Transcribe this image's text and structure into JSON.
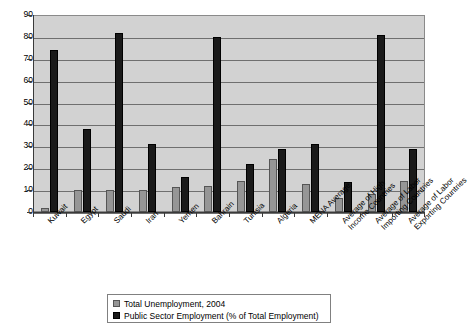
{
  "chart_data": {
    "type": "bar",
    "title": "",
    "xlabel": "",
    "ylabel": "",
    "ylim": [
      0,
      90
    ],
    "ytick_step": 10,
    "yticks": [
      90,
      80,
      70,
      60,
      50,
      40,
      30,
      20,
      10,
      0
    ],
    "grid": true,
    "legend_position": "bottom",
    "categories": [
      "Kuwait",
      "Egypt",
      "Saudi",
      "Iran",
      "Yemen",
      "Bahrain",
      "Tunisia",
      "Algeria",
      "MENA Average",
      "Average of High\nIncome Countries",
      "Average of Labor\nImporting Countries",
      "Average of Labor\nExporting Countries"
    ],
    "series": [
      {
        "name": "Total Unemployment, 2004",
        "color": "#969696",
        "values": [
          2,
          10,
          10,
          10,
          11.5,
          12,
          14,
          24,
          13,
          6.5,
          8,
          14
        ]
      },
      {
        "name": "Public Sector Employment (% of Total Employment)",
        "color": "#1a1a1a",
        "values": [
          74,
          38,
          82,
          31,
          16,
          80,
          22,
          29,
          31,
          13.5,
          81,
          29
        ]
      }
    ]
  },
  "legend": {
    "items": [
      {
        "label": "Total Unemployment, 2004",
        "swatch": "gray"
      },
      {
        "label": "Public Sector Employment (% of Total Employment)",
        "swatch": "black"
      }
    ]
  },
  "colors": {
    "plot_background": "#d2d2d2",
    "gridline": "#6f6f6f",
    "axis": "#3a3a3a",
    "series_unemployment": "#969696",
    "series_public_sector": "#1a1a1a",
    "page_background": "#ffffff"
  }
}
